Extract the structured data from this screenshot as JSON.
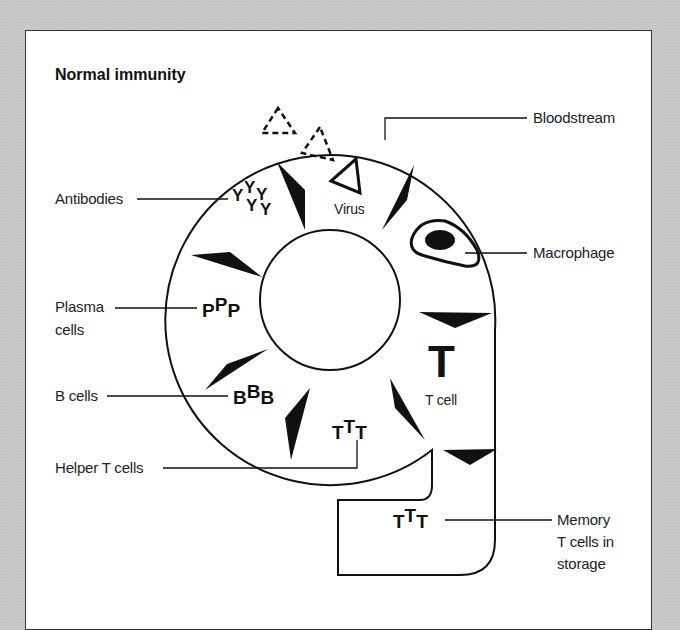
{
  "figure": {
    "title": "Normal immunity",
    "labels": {
      "bloodstream": "Bloodstream",
      "antibodies": "Antibodies",
      "virus": "Virus",
      "macrophage": "Macrophage",
      "plasma_cells_line1": "Plasma",
      "plasma_cells_line2": "cells",
      "b_cells": "B cells",
      "t_cell": "T cell",
      "helper_t_cells": "Helper T cells",
      "memory_line1": "Memory",
      "memory_line2": "T cells in",
      "memory_line3": "storage"
    },
    "glyphs": {
      "antibody": "Y",
      "plasma": "P",
      "b": "B",
      "t": "T"
    },
    "colors": {
      "background": "#c9c9c9",
      "panel": "#ffffff",
      "ink": "#111111"
    }
  }
}
